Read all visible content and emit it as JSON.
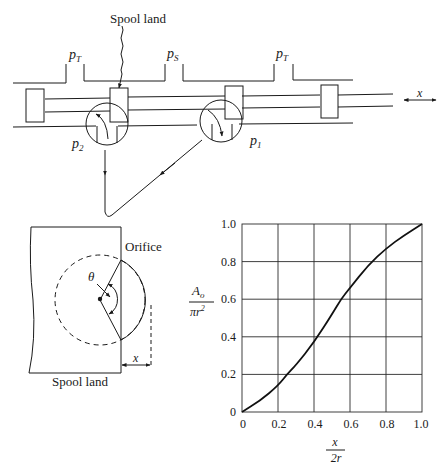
{
  "valve_diagram": {
    "spool_land_label": "Spool land",
    "port_labels": {
      "tank_left": "p",
      "tank_left_sub": "T",
      "supply": "p",
      "supply_sub": "S",
      "tank_right": "p",
      "tank_right_sub": "T",
      "load_2": "p",
      "load_2_sub": "2",
      "load_1": "p",
      "load_1_sub": "1"
    },
    "displacement_label": "x"
  },
  "orifice_diagram": {
    "orifice_label": "Orifice",
    "angle_label": "θ",
    "displacement_label": "x",
    "spool_land_label": "Spool land"
  },
  "chart_data": {
    "type": "line",
    "title": "",
    "xlabel": "x / 2r",
    "ylabel": "A_o / πr²",
    "xlabel_num": "x",
    "xlabel_den": "2r",
    "ylabel_num": "A",
    "ylabel_num_sub": "o",
    "ylabel_den": "πr",
    "ylabel_den_sup": "2",
    "xlim": [
      0,
      1.0
    ],
    "ylim": [
      0,
      1.0
    ],
    "grid": true,
    "x_ticks": [
      "0",
      "0.2",
      "0.4",
      "0.6",
      "0.8",
      "1.0"
    ],
    "y_ticks": [
      "0",
      "0.2",
      "0.4",
      "0.6",
      "0.8",
      "1.0"
    ],
    "series": [
      {
        "name": "Normalized orifice area",
        "x": [
          0,
          0.1,
          0.2,
          0.25,
          0.3,
          0.4,
          0.5,
          0.55,
          0.6,
          0.7,
          0.8,
          0.9,
          1.0
        ],
        "y": [
          0,
          0.06,
          0.14,
          0.2,
          0.25,
          0.37,
          0.52,
          0.6,
          0.66,
          0.78,
          0.87,
          0.94,
          1.0
        ]
      }
    ]
  }
}
